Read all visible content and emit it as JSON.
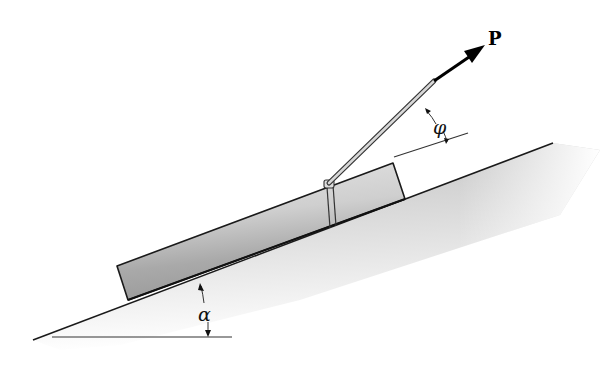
{
  "diagram": {
    "labels": {
      "force": "P",
      "rope_angle": "φ",
      "incline_angle": "α"
    },
    "colors": {
      "line": "#1a1a1a",
      "block_light": "#d9d9d9",
      "block_dark": "#8f8f8f",
      "incline_shade": "#bdbdbd",
      "background": "#ffffff"
    }
  }
}
